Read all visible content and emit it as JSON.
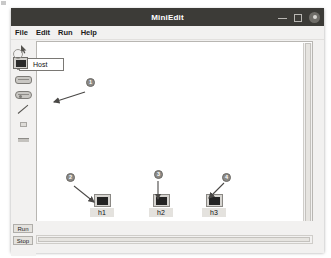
{
  "window": {
    "title": "MiniEdit",
    "controls": {
      "minimize": "minimize-icon",
      "maximize": "maximize-icon",
      "close": "close-icon"
    }
  },
  "menubar": {
    "items": [
      {
        "label": "File"
      },
      {
        "label": "Edit"
      },
      {
        "label": "Run"
      },
      {
        "label": "Help"
      }
    ]
  },
  "palette": {
    "tools": [
      {
        "name": "select-tool",
        "icon": "cursor-arrow-icon"
      },
      {
        "name": "host-tool",
        "icon": "host-monitor-icon"
      },
      {
        "name": "switch-tool",
        "icon": "switch-pill-icon"
      },
      {
        "name": "controller-tool",
        "icon": "controller-pill-icon"
      },
      {
        "name": "link-tool",
        "icon": "link-line-icon"
      },
      {
        "name": "legacy-router-tool",
        "icon": "small-box-icon"
      },
      {
        "name": "net-link-tool",
        "icon": "bar-icon"
      }
    ],
    "tooltip": {
      "label": "Host",
      "icon": "host-monitor-icon"
    }
  },
  "canvas": {
    "nodes": [
      {
        "id": "h1",
        "label": "h1",
        "icon": "host-monitor-icon",
        "x": 53,
        "y": 152
      },
      {
        "id": "h2",
        "label": "h2",
        "icon": "host-monitor-icon",
        "x": 112,
        "y": 152
      },
      {
        "id": "h3",
        "label": "h3",
        "icon": "host-monitor-icon",
        "x": 165,
        "y": 152
      }
    ]
  },
  "annotations": {
    "badges": [
      {
        "id": "badge-1",
        "label": "1",
        "x": 75,
        "y": 38
      },
      {
        "id": "badge-2",
        "label": "2",
        "x": 55,
        "y": 133
      },
      {
        "id": "badge-3",
        "label": "3",
        "x": 143,
        "y": 130
      },
      {
        "id": "badge-4",
        "label": "4",
        "x": 211,
        "y": 133
      }
    ],
    "arrows": [
      {
        "id": "arrow-to-host-tool",
        "x1": 74,
        "y1": 52,
        "x2": 41,
        "y2": 62
      },
      {
        "id": "arrow-to-h1",
        "x1": 63,
        "y1": 146,
        "x2": 84,
        "y2": 163
      },
      {
        "id": "arrow-to-h2",
        "x1": 147,
        "y1": 141,
        "x2": 147,
        "y2": 160
      },
      {
        "id": "arrow-to-h3",
        "x1": 212,
        "y1": 143,
        "x2": 197,
        "y2": 159
      }
    ]
  },
  "bottombar": {
    "run_label": "Run",
    "stop_label": "Stop"
  },
  "colors": {
    "titlebar": "#3c3b37",
    "window_bg": "#f2f1f0",
    "canvas_bg": "#ffffff",
    "badge": "#8c8a86",
    "node_icon": "#232323"
  }
}
